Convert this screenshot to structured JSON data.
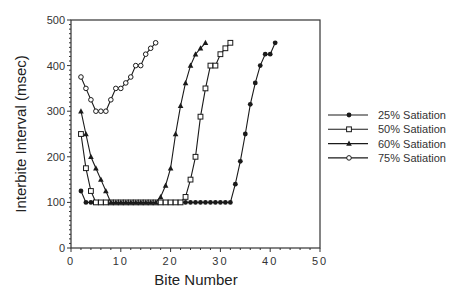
{
  "chart_data": {
    "type": "line",
    "title": "",
    "xlabel": "Bite Number",
    "ylabel": "Interbite Interval (msec)",
    "xlim": [
      0,
      50
    ],
    "ylim": [
      0,
      500
    ],
    "xticks": [
      0,
      10,
      20,
      30,
      40,
      50
    ],
    "yticks": [
      0,
      100,
      200,
      300,
      400,
      500
    ],
    "xtick_labels": [
      "0",
      "10",
      "20",
      "30",
      "40",
      "50"
    ],
    "ytick_labels": [
      "0",
      "100",
      "200",
      "300",
      "400",
      "500"
    ],
    "grid": false,
    "legend_position": "right",
    "series": [
      {
        "name": "25% Satiation",
        "marker": "filled-circle",
        "x": [
          2,
          3,
          4,
          5,
          6,
          7,
          8,
          9,
          10,
          11,
          12,
          13,
          14,
          15,
          16,
          17,
          18,
          19,
          20,
          21,
          22,
          23,
          24,
          25,
          26,
          27,
          28,
          29,
          30,
          31,
          32,
          33,
          34,
          35,
          36,
          37,
          38,
          39,
          40,
          41
        ],
        "values": [
          125,
          100,
          100,
          100,
          100,
          100,
          100,
          100,
          100,
          100,
          100,
          100,
          100,
          100,
          100,
          100,
          100,
          100,
          100,
          100,
          100,
          100,
          100,
          100,
          100,
          100,
          100,
          100,
          100,
          100,
          100,
          140,
          190,
          250,
          315,
          362,
          400,
          425,
          425,
          450
        ]
      },
      {
        "name": "50% Satiation",
        "marker": "open-square",
        "x": [
          2,
          3,
          4,
          5,
          6,
          7,
          8,
          9,
          10,
          11,
          12,
          13,
          14,
          15,
          16,
          17,
          18,
          19,
          20,
          21,
          22,
          23,
          24,
          25,
          26,
          27,
          28,
          29,
          30,
          31,
          32
        ],
        "values": [
          250,
          175,
          125,
          100,
          100,
          100,
          100,
          100,
          100,
          100,
          100,
          100,
          100,
          100,
          100,
          100,
          100,
          100,
          100,
          100,
          100,
          112,
          150,
          200,
          288,
          350,
          400,
          400,
          425,
          438,
          450
        ]
      },
      {
        "name": "60% Satiation",
        "marker": "filled-triangle",
        "x": [
          2,
          3,
          4,
          5,
          6,
          7,
          8,
          9,
          10,
          11,
          12,
          13,
          14,
          15,
          16,
          17,
          18,
          19,
          20,
          21,
          22,
          23,
          24,
          25,
          26,
          27
        ],
        "values": [
          300,
          250,
          200,
          175,
          150,
          125,
          100,
          100,
          100,
          100,
          100,
          100,
          100,
          100,
          100,
          100,
          112,
          137,
          175,
          250,
          312,
          362,
          400,
          425,
          438,
          450
        ]
      },
      {
        "name": "75% Satiation",
        "marker": "open-circle",
        "x": [
          2,
          3,
          4,
          5,
          6,
          7,
          8,
          9,
          10,
          11,
          12,
          13,
          14,
          15,
          16,
          17
        ],
        "values": [
          375,
          350,
          325,
          300,
          300,
          300,
          325,
          350,
          350,
          362,
          375,
          400,
          400,
          425,
          438,
          450
        ]
      }
    ]
  },
  "colors": {
    "line": "#1a1a1a",
    "axis": "#333333",
    "background": "#ffffff"
  }
}
